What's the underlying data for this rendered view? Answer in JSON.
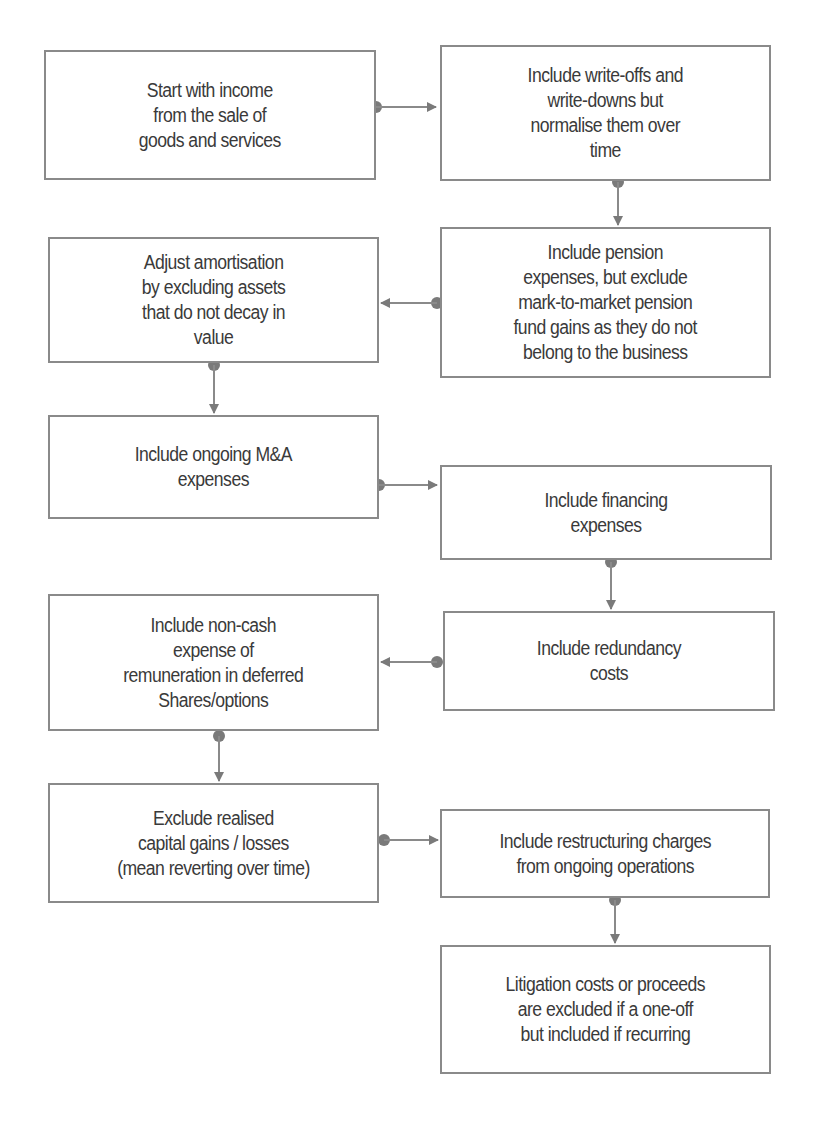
{
  "diagram": {
    "type": "flowchart",
    "colors": {
      "border": "#8a8a8a",
      "text": "#3a3a3a",
      "connector": "#7a7a7a",
      "background": "#ffffff"
    },
    "nodes": [
      {
        "id": "n1",
        "text": "Start with income\nfrom the sale of\ngoods and services"
      },
      {
        "id": "n2",
        "text": "Include write-offs and\nwrite-downs but\nnormalise them over\ntime"
      },
      {
        "id": "n3",
        "text": "Include pension\nexpenses, but exclude\nmark-to-market pension\nfund gains as they do  not\nbelong to the business"
      },
      {
        "id": "n4",
        "text": "Adjust amortisation\nby excluding assets\nthat do not decay in\nvalue"
      },
      {
        "id": "n5",
        "text": "Include ongoing M&A\nexpenses"
      },
      {
        "id": "n6",
        "text": "Include financing\nexpenses"
      },
      {
        "id": "n7",
        "text": "Include redundancy\ncosts"
      },
      {
        "id": "n8",
        "text": "Include non-cash\nexpense of\nremuneration in deferred\nShares/options"
      },
      {
        "id": "n9",
        "text": "Exclude realised\ncapital gains / losses\n(mean reverting over time)"
      },
      {
        "id": "n10",
        "text": "Include restructuring charges\nfrom ongoing operations"
      },
      {
        "id": "n11",
        "text": "Litigation costs or proceeds\nare excluded if a one-off\nbut included if recurring"
      }
    ],
    "edges": [
      {
        "from": "n1",
        "to": "n2",
        "direction": "right"
      },
      {
        "from": "n2",
        "to": "n3",
        "direction": "down"
      },
      {
        "from": "n3",
        "to": "n4",
        "direction": "left"
      },
      {
        "from": "n4",
        "to": "n5",
        "direction": "down"
      },
      {
        "from": "n5",
        "to": "n6",
        "direction": "right"
      },
      {
        "from": "n6",
        "to": "n7",
        "direction": "down"
      },
      {
        "from": "n7",
        "to": "n8",
        "direction": "left"
      },
      {
        "from": "n8",
        "to": "n9",
        "direction": "down"
      },
      {
        "from": "n9",
        "to": "n10",
        "direction": "right"
      },
      {
        "from": "n10",
        "to": "n11",
        "direction": "down"
      }
    ]
  }
}
